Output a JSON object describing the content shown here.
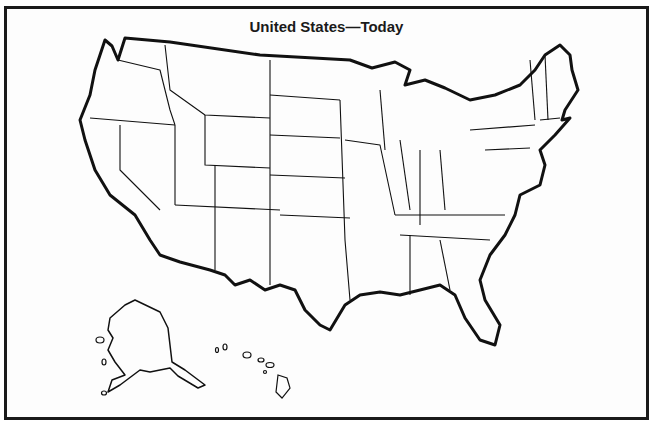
{
  "map": {
    "title": "United States—Today",
    "type": "outline political map",
    "regions_shown": [
      "Contiguous United States",
      "Alaska",
      "Hawaii"
    ],
    "labels": "none (blank outline)",
    "colors": {
      "lines": "#111111",
      "background": "#ffffff"
    }
  }
}
